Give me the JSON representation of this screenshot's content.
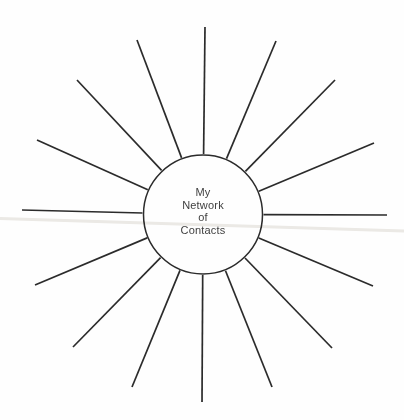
{
  "diagram": {
    "type": "spoke-map",
    "label_lines": [
      "My",
      "Network",
      "of",
      "Contacts"
    ],
    "spoke_count": 16,
    "colors": {
      "stroke": "#2b2b2b",
      "background": "#fefefe",
      "text": "#3f3f3f",
      "scan_band": "#eceae6"
    },
    "circle": {
      "cx": 203,
      "cy": 214.5,
      "r": 59.5,
      "stroke_width": 1.5
    },
    "ray_inner_radius": 60.5,
    "ray_stroke_width": 1.7,
    "rays": [
      [
        205,
        27
      ],
      [
        276,
        41
      ],
      [
        335,
        80
      ],
      [
        374,
        143
      ],
      [
        387,
        215
      ],
      [
        373,
        286
      ],
      [
        332,
        348
      ],
      [
        272,
        387
      ],
      [
        202,
        402
      ],
      [
        132,
        387
      ],
      [
        73,
        347
      ],
      [
        35,
        285
      ],
      [
        22,
        210
      ],
      [
        37,
        140
      ],
      [
        77,
        80
      ],
      [
        137,
        40
      ]
    ],
    "scan_band": {
      "x1": 0,
      "y1": 218.5,
      "x2": 404,
      "y2": 231,
      "stroke_width": 2.8
    }
  }
}
